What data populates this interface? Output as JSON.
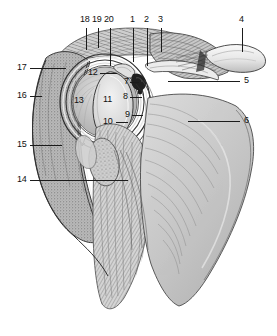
{
  "figure": {
    "view": "posterior dissection, humeral head and glenoid exposed",
    "style": "grayscale engraving",
    "background_color": "#ffffff",
    "ink_color": "#1b1b1b",
    "width": 277,
    "height": 336
  },
  "labels": [
    {
      "id": "18",
      "text": "18",
      "x": 82,
      "y": 19,
      "side": "top"
    },
    {
      "id": "19",
      "text": "19",
      "x": 94,
      "y": 19,
      "side": "top"
    },
    {
      "id": "20",
      "text": "20",
      "x": 106,
      "y": 19,
      "side": "top"
    },
    {
      "id": "1",
      "text": "1",
      "x": 131,
      "y": 19,
      "side": "top"
    },
    {
      "id": "2",
      "text": "2",
      "x": 145,
      "y": 19,
      "side": "top"
    },
    {
      "id": "3",
      "text": "3",
      "x": 159,
      "y": 19,
      "side": "top"
    },
    {
      "id": "4",
      "text": "4",
      "x": 240,
      "y": 19,
      "side": "top"
    },
    {
      "id": "5",
      "text": "5",
      "x": 243,
      "y": 78,
      "side": "right"
    },
    {
      "id": "6",
      "text": "6",
      "x": 243,
      "y": 118,
      "side": "right"
    },
    {
      "id": "7",
      "text": "7",
      "x": 125,
      "y": 80,
      "side": "inner"
    },
    {
      "id": "8",
      "text": "8",
      "x": 124,
      "y": 95,
      "side": "inner"
    },
    {
      "id": "9",
      "text": "9",
      "x": 126,
      "y": 113,
      "side": "inner"
    },
    {
      "id": "10",
      "text": "10",
      "x": 105,
      "y": 120,
      "side": "inner"
    },
    {
      "id": "11",
      "text": "11",
      "x": 104,
      "y": 98,
      "side": "inner"
    },
    {
      "id": "12",
      "text": "12",
      "x": 89,
      "y": 71,
      "side": "inner"
    },
    {
      "id": "13",
      "text": "13",
      "x": 75,
      "y": 99,
      "side": "inner"
    },
    {
      "id": "14",
      "text": "14",
      "x": 18,
      "y": 177,
      "side": "left"
    },
    {
      "id": "15",
      "text": "15",
      "x": 18,
      "y": 142,
      "side": "left"
    },
    {
      "id": "16",
      "text": "16",
      "x": 18,
      "y": 93,
      "side": "left"
    },
    {
      "id": "17",
      "text": "17",
      "x": 18,
      "y": 65,
      "side": "left"
    }
  ],
  "leaders": {
    "top": [
      {
        "for": "18",
        "x": 86,
        "y1": 28,
        "y2": 50
      },
      {
        "for": "19",
        "x": 98,
        "y1": 28,
        "y2": 48
      },
      {
        "for": "20",
        "x": 110,
        "y1": 28,
        "y2": 66
      },
      {
        "for": "1",
        "x": 133,
        "y1": 28,
        "y2": 62
      },
      {
        "for": "2",
        "x": 147,
        "y1": 28,
        "y2": 66
      },
      {
        "for": "3",
        "x": 161,
        "y1": 28,
        "y2": 52
      },
      {
        "for": "4",
        "x": 242,
        "y1": 28,
        "y2": 52
      }
    ],
    "side": [
      {
        "for": "17",
        "x1": 30,
        "x2": 66,
        "y": 68
      },
      {
        "for": "16",
        "x1": 30,
        "x2": 42,
        "y": 96
      },
      {
        "for": "15",
        "x1": 30,
        "x2": 62,
        "y": 145
      },
      {
        "for": "14",
        "x1": 30,
        "x2": 128,
        "y": 180
      },
      {
        "for": "5",
        "x1": 168,
        "x2": 240,
        "y": 81
      },
      {
        "for": "6",
        "x1": 188,
        "x2": 240,
        "y": 121
      }
    ],
    "inner": [
      {
        "for": "12",
        "x1": 100,
        "x2": 117,
        "y": 73
      },
      {
        "for": "10",
        "x1": 116,
        "x2": 128,
        "y": 122
      },
      {
        "for": "7",
        "x1": 130,
        "x2": 139,
        "y": 82
      },
      {
        "for": "8",
        "x1": 130,
        "x2": 142,
        "y": 97
      },
      {
        "for": "9",
        "x1": 132,
        "x2": 143,
        "y": 115
      }
    ]
  }
}
